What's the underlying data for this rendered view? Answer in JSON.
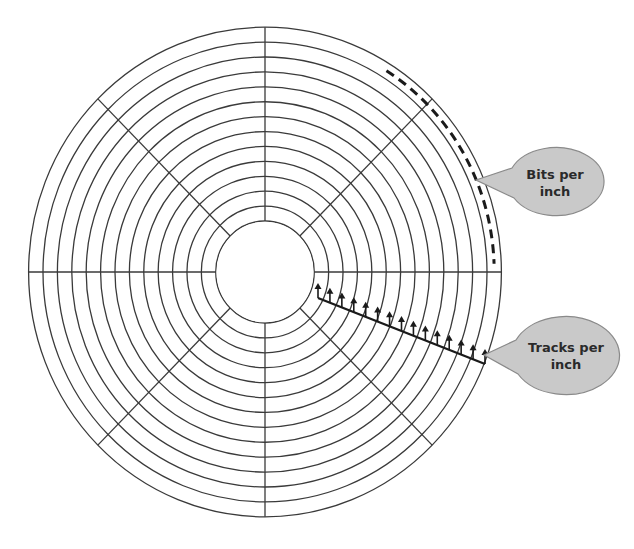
{
  "diagram": {
    "center": {
      "x": 265,
      "y": 272
    },
    "ring_count": 14,
    "inner_radius": 50,
    "outer_radius": 240,
    "sector_count": 8,
    "colors": {
      "line": "#3a3a3a",
      "callout_fill": "#c9c9c9",
      "callout_stroke": "#8a8a8a",
      "text": "#2a2a2a",
      "background": "#ffffff"
    }
  },
  "callouts": [
    {
      "id": "bits",
      "label": "Bits per\ninch"
    },
    {
      "id": "tracks",
      "label": "Tracks per\ninch"
    }
  ],
  "tracks_scale": {
    "tick_count": 15
  }
}
